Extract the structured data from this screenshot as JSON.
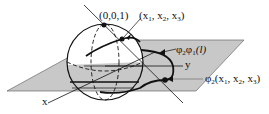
{
  "figure": {
    "colors": {
      "plane_fill": "#c8c8c8",
      "line": "#111111",
      "background": "#ffffff"
    },
    "labels": {
      "north_pole": "(0,0,1)",
      "point_on_sphere": "(x1, x2, x3)",
      "point_on_sphere_parts": {
        "open": "(x",
        "sub1": "1",
        "sep1": ", x",
        "sub2": "2",
        "sep2": ", x",
        "sub3": "3",
        "close": ")"
      },
      "image_curve": "φ₂φ₁(l)",
      "image_curve_parts": {
        "phi": "φ",
        "sub_a": "2",
        "phi2": "φ",
        "sub_b": "1",
        "arg": "(l)"
      },
      "projected_point": "φ₂(x1, x2, x3)",
      "projected_point_parts": {
        "phi": "φ",
        "sub": "2",
        "open": "(x",
        "sub1": "1",
        "sep1": ", x",
        "sub2": "2",
        "sep2": ", x",
        "sub3": "3",
        "close": ")"
      },
      "axis_x": "x",
      "axis_y": "y"
    }
  }
}
